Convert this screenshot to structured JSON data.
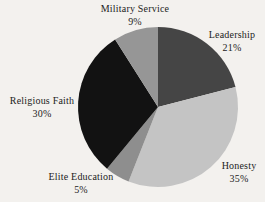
{
  "background_color": "#f3f1ee",
  "text_color": "#1c1c1c",
  "chart_data": {
    "type": "pie",
    "title": "",
    "start_angle_deg": -90,
    "direction": "clockwise",
    "legend": "none",
    "label_style": "outside, category name with percentage beneath",
    "segments": [
      {
        "id": "leadership",
        "label": "Leadership",
        "value": 21,
        "pct_label": "21%",
        "color": "#454545"
      },
      {
        "id": "honesty",
        "label": "Honesty",
        "value": 35,
        "pct_label": "35%",
        "color": "#c4c4c4"
      },
      {
        "id": "elite-education",
        "label": "Elite Education",
        "value": 5,
        "pct_label": "5%",
        "color": "#8e8e8e"
      },
      {
        "id": "religious-faith",
        "label": "Religious Faith",
        "value": 30,
        "pct_label": "30%",
        "color": "#121212"
      },
      {
        "id": "military-service",
        "label": "Military Service",
        "value": 9,
        "pct_label": "9%",
        "color": "#969696"
      }
    ]
  }
}
